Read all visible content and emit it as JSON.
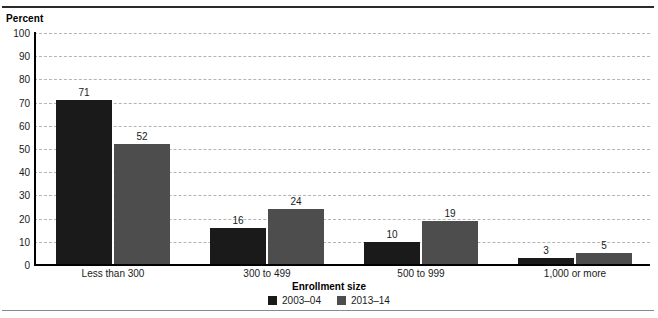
{
  "chart_data": {
    "type": "bar",
    "title": "",
    "subtitle": "",
    "xlabel": "Enrollment size",
    "ylabel": "Percent",
    "categories": [
      "Less than 300",
      "300 to 499",
      "500 to 999",
      "1,000 or more"
    ],
    "series": [
      {
        "name": "2003–04",
        "color": "#1a1a1a",
        "values": [
          71,
          16,
          10,
          3
        ]
      },
      {
        "name": "2013–14",
        "color": "#4d4d4d",
        "values": [
          52,
          24,
          19,
          5
        ]
      }
    ],
    "ylim": [
      0,
      100
    ],
    "ytick_step": 10,
    "yticks": [
      100,
      90,
      80,
      70,
      60,
      50,
      40,
      30,
      20,
      10,
      0
    ],
    "grid": "horizontal-dashed",
    "legend_position": "bottom-center",
    "annotations": "value labels above each bar"
  },
  "colors": {
    "series_2003_04": "#1a1a1a",
    "series_2013_14": "#4d4d4d",
    "gridline": "#b4b4b4",
    "axis": "#000000",
    "rule_top": "#2b2b2b",
    "rule_bottom": "#8a8a8a",
    "background": "#ffffff"
  }
}
